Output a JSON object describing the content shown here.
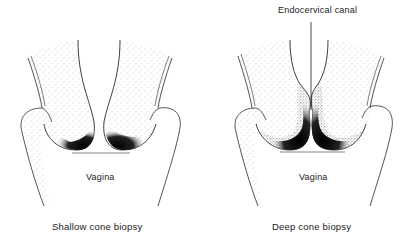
{
  "figure": {
    "panels": [
      {
        "id": "shallow",
        "caption": "Shallow cone biopsy",
        "region_label": "Vagina"
      },
      {
        "id": "deep",
        "caption": "Deep cone biopsy",
        "region_label": "Vagina",
        "annotation": "Endocervical canal"
      }
    ],
    "colors": {
      "line": "#2a2a2a",
      "shading": "#000000",
      "stipple": "#888888",
      "background": "#ffffff"
    }
  }
}
